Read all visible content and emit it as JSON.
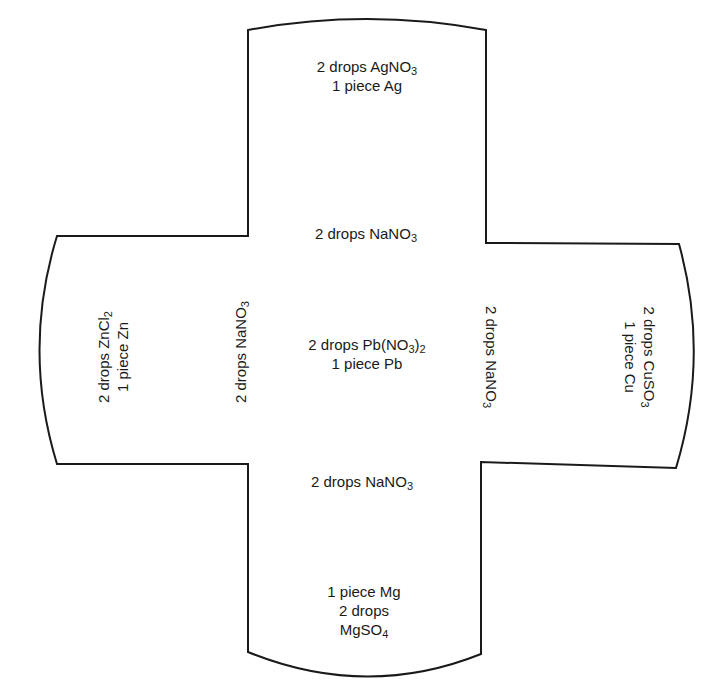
{
  "diagram": {
    "type": "cross-shaped spot plate / reaction well template",
    "wells": {
      "top": {
        "line1": "2 drops AgNO",
        "line1_sub": "3",
        "line2": "1 piece Ag"
      },
      "top_inner": {
        "text": "2 drops NaNO",
        "sub": "3"
      },
      "left": {
        "line1": "2 drops ZnCl",
        "line1_sub": "2",
        "line2": "1 piece Zn"
      },
      "left_inner": {
        "text": "2 drops NaNO",
        "sub": "3"
      },
      "center": {
        "line1": "2 drops Pb(NO",
        "line1_sub": "3",
        "line1_after": ")",
        "line1_sub2": "2",
        "line2": "1 piece Pb"
      },
      "right_inner": {
        "text": "2 drops NaNO",
        "sub": "3"
      },
      "right": {
        "line1": "2 drops CuSO",
        "line1_sub": "3",
        "line2": "1 piece Cu"
      },
      "bottom_inner": {
        "text": "2 drops NaNO",
        "sub": "3"
      },
      "bottom": {
        "line1": "1 piece Mg",
        "line2": "2 drops",
        "line3": "MgSO",
        "line3_sub": "4"
      }
    },
    "colors": {
      "stroke": "#1a1a1a",
      "background": "#ffffff"
    }
  }
}
